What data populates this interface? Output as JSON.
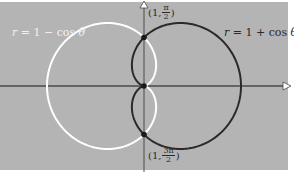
{
  "diagram": {
    "background_color": "#b4b4b4",
    "origin_px": [
      144,
      86
    ],
    "unit_px": 48.5,
    "curves": [
      {
        "name": "r = 1 - cos θ",
        "equation": "r = 1 − cos θ",
        "color": "#ffffff"
      },
      {
        "name": "r = 1 + cos θ",
        "equation": "r = 1 + cos θ",
        "color": "#2a2a2a"
      }
    ],
    "labels": {
      "left_curve": {
        "r": "r",
        "eq": " = 1 − cos ",
        "theta": "θ"
      },
      "right_curve": {
        "r": "r",
        "eq": " = 1 + cos ",
        "theta": "θ"
      }
    },
    "points": {
      "top": {
        "open": "(1, ",
        "num": "π",
        "den": "2",
        "close": ")"
      },
      "bottom": {
        "open": "(1, ",
        "num": "3π",
        "den": "2",
        "close": ")"
      }
    },
    "intersection_points": [
      "(1, π/2)",
      "origin",
      "(1, 3π/2)"
    ]
  }
}
